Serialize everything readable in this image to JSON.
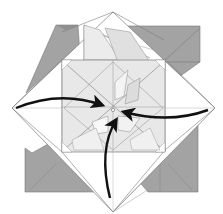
{
  "diagram": {
    "type": "origami-folding-step",
    "colors": {
      "background": "#ffffff",
      "paper_white": "#ffffff",
      "paper_light": "#e6e6e6",
      "paper_mid": "#d4d4d4",
      "paper_dark": "#a3a3a3",
      "paper_darker": "#8e8e8e",
      "crease_line": "#7a7a7a",
      "arrow": "#111111"
    },
    "center_point": {
      "x": 113,
      "y": 110
    },
    "arrows": [
      {
        "id": "left",
        "from": [
          16,
          107
        ],
        "to": [
          104,
          105
        ],
        "direction": "right"
      },
      {
        "id": "right",
        "from": [
          208,
          110
        ],
        "to": [
          122,
          112
        ],
        "direction": "left"
      },
      {
        "id": "bottom",
        "from": [
          111,
          198
        ],
        "to": [
          116,
          118
        ],
        "direction": "up"
      }
    ],
    "dark_flaps": [
      {
        "id": "top-left-flap",
        "position": "top-left"
      },
      {
        "id": "top-right-flap",
        "position": "top-right"
      },
      {
        "id": "bottom-left-flap",
        "position": "bottom-left"
      },
      {
        "id": "bottom-right-flap",
        "position": "bottom-right"
      }
    ]
  }
}
